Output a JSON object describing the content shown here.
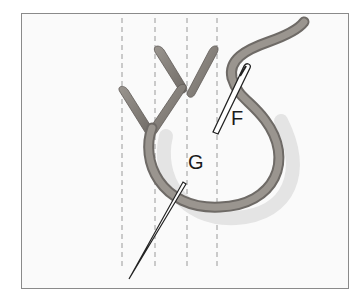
{
  "figure": {
    "type": "embroidery-stitch-diagram",
    "labels": [
      {
        "id": "F",
        "text": "F",
        "x": 231,
        "y": 108
      },
      {
        "id": "G",
        "text": "G",
        "x": 188,
        "y": 152
      }
    ],
    "colors": {
      "frame_border": "#8a8a8a",
      "background": "#fafafa",
      "thread": "#8a8580",
      "thread_dark": "#6e6a66",
      "guide_lines": "#9a9a9a",
      "needle": "#333333"
    },
    "guide_lines_x": [
      122,
      155,
      187,
      217
    ]
  }
}
